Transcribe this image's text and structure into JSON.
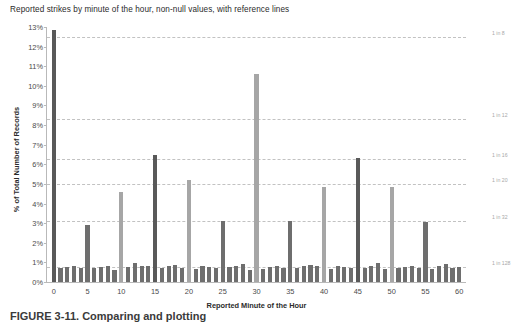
{
  "figure": {
    "caption": "FIGURE 3-11.  Comparing and plotting"
  },
  "chart_data": {
    "type": "bar",
    "title": "Reported strikes by minute of the hour, non-null values, with reference lines",
    "xlabel": "Reported Minute of the Hour",
    "ylabel": "% of Total Number of Records",
    "ylim": [
      0,
      13
    ],
    "y_ticks": [
      "0%",
      "1%",
      "2%",
      "3%",
      "4%",
      "5%",
      "6%",
      "7%",
      "8%",
      "9%",
      "10%",
      "11%",
      "12%",
      "13%"
    ],
    "y_tick_values": [
      0,
      1,
      2,
      3,
      4,
      5,
      6,
      7,
      8,
      9,
      10,
      11,
      12,
      13
    ],
    "xlim": [
      -1,
      61
    ],
    "x_ticks": [
      "0",
      "5",
      "10",
      "15",
      "20",
      "25",
      "30",
      "35",
      "40",
      "45",
      "50",
      "55",
      "60"
    ],
    "x_tick_values": [
      0,
      5,
      10,
      15,
      20,
      25,
      30,
      35,
      40,
      45,
      50,
      55,
      60
    ],
    "grid": false,
    "legend": "none",
    "bar_color_default": "#6e6e6e",
    "bar_color_highlight": "#595959",
    "bar_color_light": "#a6a6a6",
    "reference_lines": [
      {
        "label": "1 in 8",
        "value": 12.5
      },
      {
        "label": "1 in 12",
        "value": 8.333
      },
      {
        "label": "1 in 16",
        "value": 6.25
      },
      {
        "label": "1 in 20",
        "value": 5.0
      },
      {
        "label": "1 in 32",
        "value": 3.125
      },
      {
        "label": "1 in 128",
        "value": 0.781
      }
    ],
    "categories": [
      0,
      1,
      2,
      3,
      4,
      5,
      6,
      7,
      8,
      9,
      10,
      11,
      12,
      13,
      14,
      15,
      16,
      17,
      18,
      19,
      20,
      21,
      22,
      23,
      24,
      25,
      26,
      27,
      28,
      29,
      30,
      31,
      32,
      33,
      34,
      35,
      36,
      37,
      38,
      39,
      40,
      41,
      42,
      43,
      44,
      45,
      46,
      47,
      48,
      49,
      50,
      51,
      52,
      53,
      54,
      55,
      56,
      57,
      58,
      59,
      60
    ],
    "values": [
      12.85,
      0.72,
      0.78,
      0.8,
      0.72,
      2.9,
      0.7,
      0.76,
      0.82,
      0.6,
      4.6,
      0.76,
      0.95,
      0.82,
      0.8,
      6.45,
      0.72,
      0.8,
      0.86,
      0.74,
      5.2,
      0.68,
      0.82,
      0.78,
      0.72,
      3.1,
      0.76,
      0.84,
      0.92,
      0.62,
      10.6,
      0.68,
      0.78,
      0.84,
      0.74,
      3.1,
      0.7,
      0.84,
      0.88,
      0.8,
      4.85,
      0.66,
      0.8,
      0.76,
      0.72,
      6.3,
      0.7,
      0.82,
      0.96,
      0.64,
      4.85,
      0.7,
      0.76,
      0.82,
      0.74,
      3.05,
      0.68,
      0.8,
      0.9,
      0.72,
      0.78
    ],
    "bar_shades": [
      "dark",
      "mid",
      "mid",
      "mid",
      "mid",
      "mid",
      "mid",
      "mid",
      "mid",
      "mid",
      "light",
      "mid",
      "mid",
      "mid",
      "mid",
      "dark",
      "mid",
      "mid",
      "mid",
      "mid",
      "light",
      "mid",
      "mid",
      "mid",
      "mid",
      "mid",
      "mid",
      "mid",
      "mid",
      "mid",
      "light",
      "mid",
      "mid",
      "mid",
      "mid",
      "mid",
      "mid",
      "mid",
      "mid",
      "mid",
      "light",
      "mid",
      "mid",
      "mid",
      "mid",
      "dark",
      "mid",
      "mid",
      "mid",
      "mid",
      "light",
      "mid",
      "mid",
      "mid",
      "mid",
      "mid",
      "mid",
      "mid",
      "mid",
      "mid",
      "mid"
    ]
  }
}
